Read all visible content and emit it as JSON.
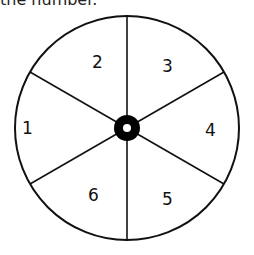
{
  "caption": "the number.",
  "spinner": {
    "center": [
      127,
      128
    ],
    "radius": 112,
    "sections": [
      {
        "label": "1",
        "x": 22,
        "y": 134
      },
      {
        "label": "2",
        "x": 92,
        "y": 68
      },
      {
        "label": "3",
        "x": 162,
        "y": 72
      },
      {
        "label": "4",
        "x": 205,
        "y": 136
      },
      {
        "label": "5",
        "x": 162,
        "y": 205
      },
      {
        "label": "6",
        "x": 88,
        "y": 201
      }
    ]
  }
}
